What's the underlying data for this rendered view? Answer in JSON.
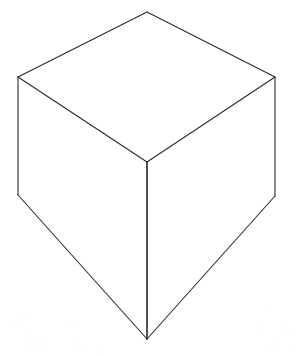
{
  "canvas": {
    "width": 296,
    "height": 356,
    "background_color": "#ffffff",
    "title": "Line drawing of a cube"
  },
  "drawing": {
    "subject": "cube",
    "style": "wireframe-outline",
    "stroke_color": "#2b2b2b",
    "stroke_color_front_edge": "#1a1a1a",
    "stroke_width": 1.1,
    "fill_color": "#ffffff",
    "projection": "three-point-perspective",
    "viewpoint": "above, looking down at near vertical corner",
    "vertices": {
      "top_apex": [
        147,
        12
      ],
      "top_left": [
        18,
        77
      ],
      "top_right": [
        275,
        77
      ],
      "center_front": [
        147,
        162
      ],
      "bottom_left": [
        18,
        195
      ],
      "bottom_right": [
        275,
        196
      ],
      "bottom_apex": [
        147,
        339
      ]
    },
    "faces": [
      {
        "name": "top-face",
        "points": "147,12 275,77 147,162 18,77"
      },
      {
        "name": "left-face",
        "points": "18,77 147,162 147,339 18,195"
      },
      {
        "name": "right-face",
        "points": "147,162 275,77 275,196 147,339"
      }
    ],
    "edges": [
      {
        "name": "top-back-left-edge",
        "from": [
          18,
          77
        ],
        "to": [
          147,
          12
        ]
      },
      {
        "name": "top-back-right-edge",
        "from": [
          147,
          12
        ],
        "to": [
          275,
          77
        ]
      },
      {
        "name": "top-front-left-edge",
        "from": [
          18,
          77
        ],
        "to": [
          147,
          162
        ]
      },
      {
        "name": "top-front-right-edge",
        "from": [
          147,
          162
        ],
        "to": [
          275,
          77
        ]
      },
      {
        "name": "left-vertical-edge",
        "from": [
          18,
          77
        ],
        "to": [
          18,
          195
        ]
      },
      {
        "name": "right-vertical-edge",
        "from": [
          275,
          77
        ],
        "to": [
          275,
          196
        ]
      },
      {
        "name": "front-vertical-edge",
        "from": [
          147,
          162
        ],
        "to": [
          147,
          339
        ]
      },
      {
        "name": "bottom-left-edge",
        "from": [
          18,
          195
        ],
        "to": [
          147,
          339
        ]
      },
      {
        "name": "bottom-right-edge",
        "from": [
          275,
          196
        ],
        "to": [
          147,
          339
        ]
      }
    ],
    "specks": [
      {
        "x": 18,
        "y": 315,
        "w": 7,
        "h": 5
      },
      {
        "x": 8,
        "y": 324,
        "w": 10,
        "h": 3
      },
      {
        "x": 24,
        "y": 331,
        "w": 5,
        "h": 6
      },
      {
        "x": 38,
        "y": 341,
        "w": 6,
        "h": 7
      },
      {
        "x": 30,
        "y": 346,
        "w": 9,
        "h": 4
      },
      {
        "x": 70,
        "y": 320,
        "w": 8,
        "h": 6
      },
      {
        "x": 33,
        "y": 337,
        "w": 12,
        "h": 3
      },
      {
        "x": 74,
        "y": 340,
        "w": 7,
        "h": 9
      },
      {
        "x": 255,
        "y": 324,
        "w": 6,
        "h": 7
      },
      {
        "x": 281,
        "y": 326,
        "w": 9,
        "h": 5
      },
      {
        "x": 271,
        "y": 342,
        "w": 5,
        "h": 8
      },
      {
        "x": 290,
        "y": 345,
        "w": 5,
        "h": 6
      },
      {
        "x": 263,
        "y": 305,
        "w": 7,
        "h": 4
      },
      {
        "x": 96,
        "y": 348,
        "w": 6,
        "h": 5
      }
    ]
  }
}
